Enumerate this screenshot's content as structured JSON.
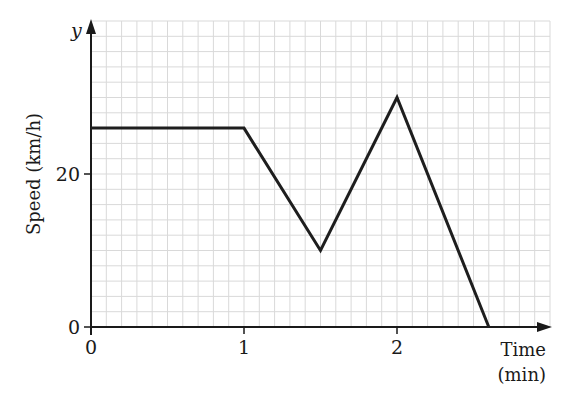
{
  "chart_data": {
    "type": "line",
    "title": "",
    "xlabel": "Time (min)",
    "xlabel_lines": [
      "Time",
      "(min)"
    ],
    "ylabel": "Speed (km/h)",
    "y_axis_symbol": "y",
    "x_ticks": [
      0,
      1,
      2
    ],
    "x_tick_labels": [
      "0",
      "1",
      "2"
    ],
    "y_ticks": [
      0,
      20
    ],
    "y_tick_labels": [
      "0",
      "20"
    ],
    "xlim": [
      0,
      3
    ],
    "ylim": [
      0,
      40
    ],
    "grid": true,
    "grid_minor_x": 0.1,
    "grid_minor_y": 2,
    "legend": null,
    "series": [
      {
        "name": "speed",
        "x": [
          0,
          1,
          1.5,
          2,
          2.6
        ],
        "y": [
          26,
          26,
          10,
          30,
          0
        ]
      }
    ]
  },
  "layout": {
    "origin_px": [
      91,
      327
    ],
    "px_per_x": 153,
    "px_per_y": 7.65,
    "colors": {
      "grid": "#d9d9d9",
      "axis": "#1a1a1a",
      "line": "#1e1e1e"
    }
  }
}
